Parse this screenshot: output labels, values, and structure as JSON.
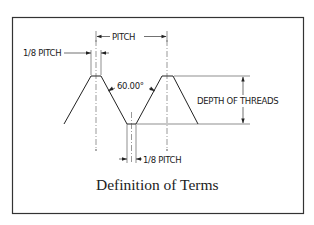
{
  "diagram": {
    "labels": {
      "pitch": "PITCH",
      "eighth_pitch_top": "1/8 PITCH",
      "angle": "60.00°",
      "depth": "DEPTH OF THREADS",
      "eighth_pitch_bottom": "1/8 PITCH"
    },
    "caption": "Definition of Terms",
    "colors": {
      "line": "#222222",
      "background": "#ffffff"
    }
  }
}
